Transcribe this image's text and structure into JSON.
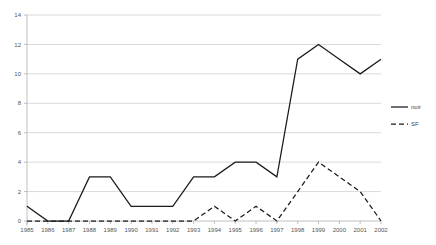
{
  "chart_data": {
    "type": "line",
    "title": "",
    "xlabel": "",
    "ylabel": "",
    "categories": [
      "1985",
      "1986",
      "1987",
      "1988",
      "1989",
      "1990",
      "1991",
      "1992",
      "1993",
      "1994",
      "1995",
      "1996",
      "1997",
      "1998",
      "1999",
      "2000",
      "2001",
      "2002"
    ],
    "series": [
      {
        "name": "noir",
        "style": "solid",
        "color": "#1a1a1a",
        "values": [
          1,
          0,
          0,
          3,
          3,
          1,
          1,
          1,
          3,
          3,
          4,
          4,
          3,
          11,
          12,
          11,
          10,
          11
        ]
      },
      {
        "name": "SF",
        "style": "dashed",
        "color": "#1a1a1a",
        "values": [
          0,
          0,
          0,
          0,
          0,
          0,
          0,
          0,
          0,
          1,
          0,
          1,
          0,
          2,
          4,
          3,
          2,
          0
        ]
      }
    ],
    "ylim": [
      0,
      14
    ],
    "yticks": [
      0,
      2,
      4,
      6,
      8,
      10,
      12,
      14
    ],
    "ytick_labels": [
      "0",
      "2",
      "4",
      "6",
      "8",
      "10",
      "12",
      "14"
    ],
    "grid": true,
    "grid_axis": "y",
    "legend_position": "right",
    "legend_entries": [
      {
        "label": "noir",
        "style": "solid"
      },
      {
        "label": "SF",
        "style": "dashed"
      }
    ]
  }
}
